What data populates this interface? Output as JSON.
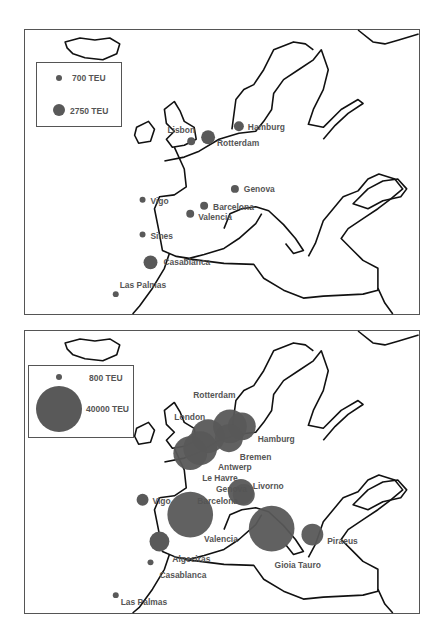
{
  "figure": {
    "bubble_color": "#595959",
    "panels": [
      {
        "id": "top",
        "legend": [
          {
            "label": "700 TEU",
            "teu": 700
          },
          {
            "label": "2750 TEU",
            "teu": 2750
          }
        ],
        "ports": [
          {
            "name": "Lisbon",
            "size": "small-medium"
          },
          {
            "name": "Rotterdam",
            "size": "large"
          },
          {
            "name": "Hamburg",
            "size": "medium"
          },
          {
            "name": "Vigo",
            "size": "small"
          },
          {
            "name": "Sines",
            "size": "small"
          },
          {
            "name": "Genova",
            "size": "small-medium"
          },
          {
            "name": "Barcelona",
            "size": "small-medium"
          },
          {
            "name": "Valencia",
            "size": "small-medium"
          },
          {
            "name": "Casablanca",
            "size": "large"
          },
          {
            "name": "Las Palmas",
            "size": "small"
          }
        ]
      },
      {
        "id": "bottom",
        "legend": [
          {
            "label": "800 TEU",
            "teu": 800
          },
          {
            "label": "40000 TEU",
            "teu": 40000
          }
        ],
        "ports": [
          {
            "name": "Rotterdam",
            "size": "very-large"
          },
          {
            "name": "Hamburg",
            "size": "large"
          },
          {
            "name": "London",
            "size": "large"
          },
          {
            "name": "Bremen",
            "size": "large"
          },
          {
            "name": "Antwerp",
            "size": "large"
          },
          {
            "name": "Le Havre",
            "size": "very-large"
          },
          {
            "name": "Genova",
            "size": "medium"
          },
          {
            "name": "Livorno",
            "size": "medium"
          },
          {
            "name": "Barcelona",
            "size": "very-large"
          },
          {
            "name": "Vigo",
            "size": "small"
          },
          {
            "name": "Valencia",
            "size": "very-large"
          },
          {
            "name": "Algeciras",
            "size": "medium"
          },
          {
            "name": "Gioia Tauro",
            "size": "very-large"
          },
          {
            "name": "Piraeus",
            "size": "medium"
          },
          {
            "name": "Casablanca",
            "size": "tiny"
          },
          {
            "name": "Las Palmas",
            "size": "tiny"
          }
        ]
      }
    ]
  }
}
